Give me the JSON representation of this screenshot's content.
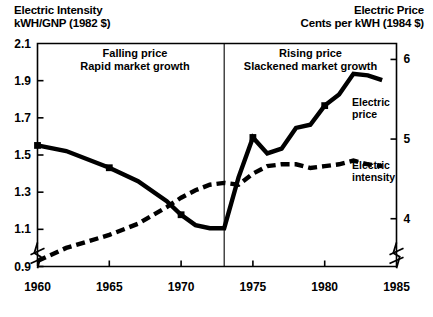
{
  "titles": {
    "left": "Electric Intensity\nkWH/GNP (1982 $)",
    "right": "Electric Price\nCents per kWH (1984 $)"
  },
  "annotations": {
    "left": "Falling price\nRapid market growth",
    "right": "Rising price\nSlackened market growth"
  },
  "series_labels": {
    "price": "Electric\nprice",
    "intensity": "Electric\nintensity"
  },
  "axes": {
    "y_left_ticks": [
      "2.1",
      "1.9",
      "1.7",
      "1.5",
      "1.3",
      "1.1",
      "0.9"
    ],
    "y_right_ticks": [
      "6",
      "5",
      "4"
    ],
    "x_ticks": [
      "1960",
      "1965",
      "1970",
      "1975",
      "1980",
      "1985"
    ]
  },
  "chart_data": {
    "type": "line",
    "xlabel": "",
    "ylabel": "kWH/GNP (1982 $)",
    "y2label": "Cents per kWH (1984 $)",
    "xlim": [
      1960,
      1985
    ],
    "ylim": [
      0.9,
      2.1
    ],
    "y2lim": [
      3.4,
      6.2
    ],
    "grid": false,
    "legend": "inline-right",
    "divider_x": 1973,
    "divider_note": "1973 oil shock separates falling-price era from rising-price era",
    "axis_break": "both y-axes and x-axis origin are broken (zigzag symbol)",
    "series": [
      {
        "name": "Electric price",
        "style": "solid",
        "axis": "right",
        "units": "Cents per kWH (1984 $)",
        "x": [
          1960,
          1962,
          1965,
          1967,
          1969,
          1970,
          1971,
          1972,
          1973,
          1974,
          1975,
          1976,
          1977,
          1978,
          1979,
          1980,
          1981,
          1982,
          1983,
          1984
        ],
        "values": [
          4.92,
          4.85,
          4.64,
          4.47,
          4.22,
          4.05,
          3.92,
          3.88,
          3.88,
          4.52,
          5.02,
          4.82,
          4.88,
          5.14,
          5.18,
          5.42,
          5.56,
          5.82,
          5.8,
          5.74
        ]
      },
      {
        "name": "Electric intensity",
        "style": "dashed",
        "axis": "left",
        "units": "kWH/GNP (1982 $)",
        "x": [
          1960,
          1962,
          1965,
          1967,
          1969,
          1970,
          1971,
          1972,
          1973,
          1974,
          1975,
          1976,
          1977,
          1978,
          1979,
          1980,
          1981,
          1982,
          1983,
          1984
        ],
        "values": [
          0.93,
          1.0,
          1.07,
          1.13,
          1.22,
          1.27,
          1.31,
          1.34,
          1.35,
          1.34,
          1.4,
          1.44,
          1.45,
          1.45,
          1.43,
          1.44,
          1.45,
          1.47,
          1.45,
          1.44
        ]
      }
    ]
  }
}
